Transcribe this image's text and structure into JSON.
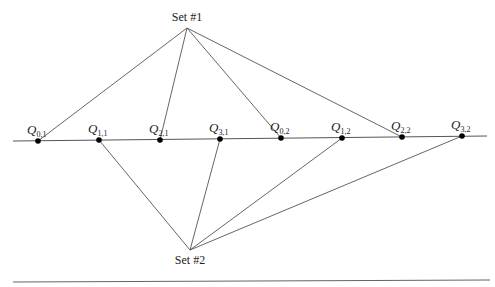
{
  "diagram": {
    "title": "",
    "sets": [
      {
        "id": "set1",
        "label": "Set #1",
        "x": 187,
        "y": 28,
        "label_x": 187,
        "label_y": 21,
        "connects": [
          "Q0,1",
          "Q2,1",
          "Q0,2",
          "Q2,2"
        ]
      },
      {
        "id": "set2",
        "label": "Set #2",
        "x": 190,
        "y": 250,
        "label_x": 190,
        "label_y": 264,
        "connects": [
          "Q1,1",
          "Q3,1",
          "Q1,2",
          "Q3,2"
        ]
      }
    ],
    "axis_line": {
      "x1": 13,
      "y1": 141,
      "x2": 487,
      "y2": 136
    },
    "points": [
      {
        "id": "Q0,1",
        "symbol": "Q",
        "sub": "0,1",
        "x": 38,
        "y": 141
      },
      {
        "id": "Q1,1",
        "symbol": "Q",
        "sub": "1,1",
        "x": 99,
        "y": 140
      },
      {
        "id": "Q2,1",
        "symbol": "Q",
        "sub": "2,1",
        "x": 160,
        "y": 140
      },
      {
        "id": "Q3,1",
        "symbol": "Q",
        "sub": "3,1",
        "x": 220,
        "y": 139
      },
      {
        "id": "Q0,2",
        "symbol": "Q",
        "sub": "0,2",
        "x": 281,
        "y": 138
      },
      {
        "id": "Q1,2",
        "symbol": "Q",
        "sub": "1,2",
        "x": 342,
        "y": 138
      },
      {
        "id": "Q2,2",
        "symbol": "Q",
        "sub": "2,2",
        "x": 402,
        "y": 137
      },
      {
        "id": "Q3,2",
        "symbol": "Q",
        "sub": "3,2",
        "x": 462,
        "y": 136
      }
    ],
    "bottom_rule": {
      "x1": 13,
      "y1": 282,
      "x2": 490,
      "y2": 280
    },
    "colors": {
      "line": "#555555",
      "dot": "#000000",
      "text": "#222222"
    }
  }
}
